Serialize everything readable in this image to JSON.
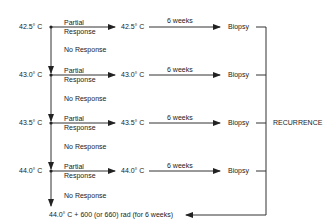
{
  "diagram": {
    "rows": [
      {
        "temp": "42.5° C",
        "partial": "Partial",
        "response": "Response",
        "target": "42.5° C",
        "interval": "6 weeks",
        "biopsy": "Biopsy",
        "no_response": "No Response"
      },
      {
        "temp": "43.0° C",
        "partial": "Partial",
        "response": "Response",
        "target": "43.0° C",
        "interval": "6 weeks",
        "biopsy": "Biopsy",
        "no_response": "No Response"
      },
      {
        "temp": "43.5° C",
        "partial": "Partial",
        "response": "Response",
        "target": "43.5° C",
        "interval": "6 weeks",
        "biopsy": "Biopsy",
        "no_response": "No Response"
      },
      {
        "temp": "44.0° C",
        "partial": "Partial",
        "response": "Response",
        "target": "44.0° C",
        "interval": "6 weeks",
        "biopsy": "Biopsy",
        "no_response": "No Response"
      }
    ],
    "recurrence": "RECURRENCE",
    "final": "44.0° C + 600 (or 660) rad (for 6 weeks)"
  }
}
